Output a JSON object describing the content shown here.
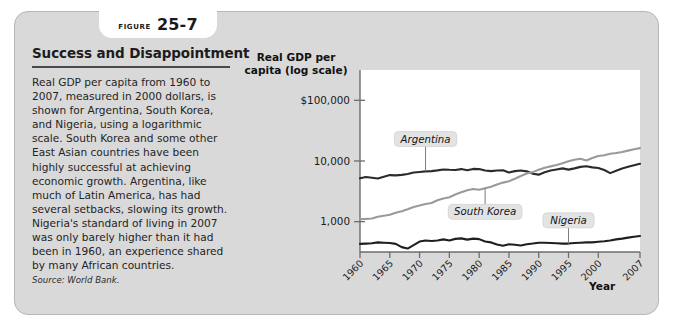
{
  "figure": {
    "tab_word": "FIGURE",
    "tab_number": "25-7",
    "title": "Success and Disappointment",
    "body": "Real GDP per capita from 1960 to 2007, measured in 2000 dollars, is shown for Argentina, South Korea, and Nigeria, using a logarithmic scale. South Korea and some other East Asian countries have been highly successful at achieving economic growth. Argentina, like much of Latin America, has had several setbacks, slowing its growth. Nigeria's standard of living in 2007 was only barely higher than it had been in 1960, an experience shared by many African countries.",
    "source": "Source: World Bank."
  },
  "chart_data": {
    "type": "line",
    "title": "",
    "ylabel": "Real GDP per\ncapita (log scale)",
    "ylabel_line1": "Real GDP per",
    "ylabel_line2": "capita (log scale)",
    "xlabel": "Year",
    "log_scale": true,
    "ylim": [
      316,
      316000
    ],
    "ytick_values": [
      100000,
      10000,
      1000
    ],
    "ytick_labels": [
      "$100,000",
      "10,000",
      "1,000"
    ],
    "xlim": [
      1960,
      2007
    ],
    "xtick_labels": [
      "1960",
      "1965",
      "1970",
      "1975",
      "1980",
      "1985",
      "1990",
      "1995",
      "2000",
      "2007"
    ],
    "xtick_values": [
      1960,
      1965,
      1970,
      1975,
      1980,
      1985,
      1990,
      1995,
      2000,
      2007
    ],
    "grid": false,
    "legend_position": "inline-labels",
    "series": [
      {
        "name": "Argentina",
        "color": "#2b2b2b",
        "label_x": 1971,
        "label_y": 23000,
        "x": [
          1960,
          1961,
          1962,
          1963,
          1964,
          1965,
          1966,
          1967,
          1968,
          1969,
          1970,
          1971,
          1972,
          1973,
          1974,
          1975,
          1976,
          1977,
          1978,
          1979,
          1980,
          1981,
          1982,
          1983,
          1984,
          1985,
          1986,
          1987,
          1988,
          1989,
          1990,
          1991,
          1992,
          1993,
          1994,
          1995,
          1996,
          1997,
          1998,
          1999,
          2000,
          2001,
          2002,
          2003,
          2004,
          2005,
          2006,
          2007
        ],
        "values": [
          5200,
          5450,
          5300,
          5150,
          5500,
          5850,
          5800,
          5900,
          6100,
          6450,
          6600,
          6750,
          6800,
          7000,
          7250,
          7150,
          7100,
          7350,
          7050,
          7400,
          7350,
          6950,
          6800,
          6950,
          7050,
          6450,
          6800,
          6950,
          6750,
          6150,
          5950,
          6500,
          6950,
          7250,
          7550,
          7200,
          7550,
          8000,
          8200,
          7850,
          7650,
          7100,
          6300,
          6900,
          7500,
          8000,
          8500,
          9000
        ]
      },
      {
        "name": "South Korea",
        "color": "#9a9a9a",
        "label_x": 1981,
        "label_y": 1450,
        "x": [
          1960,
          1961,
          1962,
          1963,
          1964,
          1965,
          1966,
          1967,
          1968,
          1969,
          1970,
          1971,
          1972,
          1973,
          1974,
          1975,
          1976,
          1977,
          1978,
          1979,
          1980,
          1981,
          1982,
          1983,
          1984,
          1985,
          1986,
          1987,
          1988,
          1989,
          1990,
          1991,
          1992,
          1993,
          1994,
          1995,
          1996,
          1997,
          1998,
          1999,
          2000,
          2001,
          2002,
          2003,
          2004,
          2005,
          2006,
          2007
        ],
        "values": [
          1100,
          1110,
          1130,
          1200,
          1250,
          1300,
          1400,
          1480,
          1600,
          1750,
          1850,
          1950,
          2030,
          2250,
          2400,
          2520,
          2800,
          3050,
          3300,
          3450,
          3350,
          3550,
          3750,
          4100,
          4400,
          4650,
          5100,
          5650,
          6200,
          6550,
          7150,
          7750,
          8150,
          8600,
          9200,
          9900,
          10500,
          10900,
          10200,
          11200,
          12100,
          12450,
          13200,
          13500,
          14100,
          14800,
          15600,
          16300
        ]
      },
      {
        "name": "Nigeria",
        "color": "#1f1f1f",
        "label_x": 1995,
        "label_y": 1050,
        "x": [
          1960,
          1961,
          1962,
          1963,
          1964,
          1965,
          1966,
          1967,
          1968,
          1969,
          1970,
          1971,
          1972,
          1973,
          1974,
          1975,
          1976,
          1977,
          1978,
          1979,
          1980,
          1981,
          1982,
          1983,
          1984,
          1985,
          1986,
          1987,
          1988,
          1989,
          1990,
          1991,
          1992,
          1993,
          1994,
          1995,
          1996,
          1997,
          1998,
          1999,
          2000,
          2001,
          2002,
          2003,
          2004,
          2005,
          2006,
          2007
        ],
        "values": [
          430,
          435,
          440,
          455,
          450,
          445,
          430,
          380,
          360,
          410,
          470,
          490,
          480,
          490,
          510,
          490,
          520,
          530,
          505,
          525,
          515,
          470,
          455,
          420,
          400,
          425,
          415,
          405,
          425,
          435,
          450,
          450,
          445,
          440,
          435,
          435,
          445,
          450,
          455,
          455,
          465,
          475,
          490,
          510,
          525,
          545,
          565,
          580
        ]
      }
    ]
  }
}
